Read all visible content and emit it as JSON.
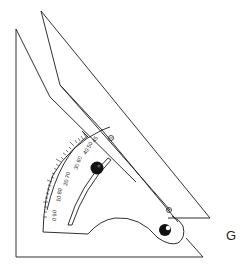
{
  "figure": {
    "caption_letter": "G",
    "scale_labels": [
      {
        "text": "45",
        "x": 95,
        "y": 143,
        "rot": -60
      },
      {
        "text": "40 50",
        "x": 88,
        "y": 152,
        "rot": -60
      },
      {
        "text": "30 60",
        "x": 79,
        "y": 166,
        "rot": -68
      },
      {
        "text": "20 70",
        "x": 69,
        "y": 182,
        "rot": -76
      },
      {
        "text": "10 80",
        "x": 61,
        "y": 198,
        "rot": -82
      },
      {
        "text": "0 90",
        "x": 57,
        "y": 216,
        "rot": -88
      }
    ],
    "colors": {
      "line": "#1a1a1a",
      "knob": "#111111",
      "background": "#ffffff"
    }
  }
}
